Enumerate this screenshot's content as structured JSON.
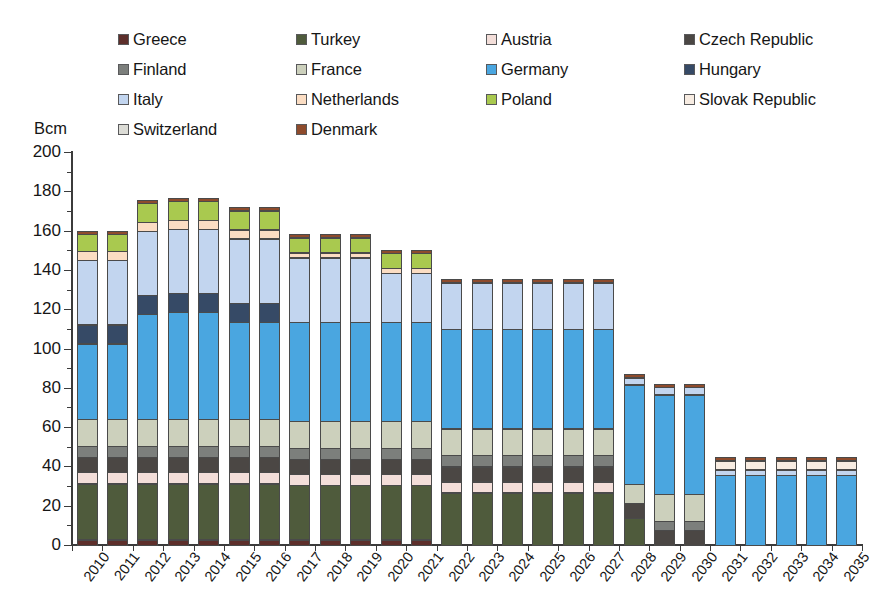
{
  "axis": {
    "y_unit_label": "Bcm",
    "y_ticks": [
      0,
      20,
      40,
      60,
      80,
      100,
      120,
      140,
      160,
      180,
      200
    ]
  },
  "legend": {
    "rows": [
      [
        {
          "label": "Greece",
          "color": "#5d2f2b"
        },
        {
          "label": "Turkey",
          "color": "#4f5b3c"
        },
        {
          "label": "Austria",
          "color": "#f3ded9"
        },
        {
          "label": "Czech Republic",
          "color": "#4b4744"
        }
      ],
      [
        {
          "label": "Finland",
          "color": "#7c7f7c"
        },
        {
          "label": "France",
          "color": "#ccd0bc"
        },
        {
          "label": "Germany",
          "color": "#4aa6e0"
        },
        {
          "label": "Hungary",
          "color": "#364a66"
        }
      ],
      [
        {
          "label": "Italy",
          "color": "#c2d5ef"
        },
        {
          "label": "Netherlands",
          "color": "#fbddc3"
        },
        {
          "label": "Poland",
          "color": "#a9c94f"
        },
        {
          "label": "Slovak Republic",
          "color": "#f7ece2"
        }
      ],
      [
        {
          "label": "Switzerland",
          "color": "#dcdcd6"
        },
        {
          "label": "Denmark",
          "color": "#8e4b2c"
        }
      ]
    ]
  },
  "chart_data": {
    "type": "bar",
    "stacked": true,
    "title": "",
    "xlabel": "",
    "ylabel": "Bcm",
    "ylim": [
      0,
      200
    ],
    "ytick_step": 20,
    "yminor_step": 10,
    "grid": false,
    "legend_position": "top",
    "categories": [
      "2010",
      "2011",
      "2012",
      "2013",
      "2014",
      "2015",
      "2016",
      "2017",
      "2018",
      "2019",
      "2020",
      "2021",
      "2022",
      "2023",
      "2024",
      "2025",
      "2026",
      "2027",
      "2028",
      "2029",
      "2030",
      "2031",
      "2032",
      "2033",
      "2034",
      "2035"
    ],
    "series": [
      {
        "name": "Greece",
        "color": "#5d2f2b",
        "values": [
          3,
          3,
          3,
          3,
          3,
          3,
          3,
          3,
          3,
          3,
          3,
          3,
          0,
          0,
          0,
          0,
          0,
          0,
          0,
          0,
          0,
          0,
          0,
          0,
          0,
          0
        ]
      },
      {
        "name": "Turkey",
        "color": "#4f5b3c",
        "values": [
          29,
          29,
          29,
          29,
          29,
          29,
          29,
          28,
          28,
          28,
          28,
          28,
          27,
          27,
          27,
          27,
          27,
          27,
          14,
          0,
          0,
          0,
          0,
          0,
          0,
          0
        ]
      },
      {
        "name": "Austria",
        "color": "#f3ded9",
        "values": [
          6,
          6,
          6,
          6,
          6,
          6,
          6,
          6,
          6,
          6,
          6,
          6,
          6,
          6,
          6,
          6,
          6,
          6,
          0,
          0,
          0,
          0,
          0,
          0,
          0,
          0
        ]
      },
      {
        "name": "Czech Republic",
        "color": "#4b4744",
        "values": [
          8,
          8,
          8,
          8,
          8,
          8,
          8,
          8,
          8,
          8,
          8,
          8,
          8,
          8,
          8,
          8,
          8,
          8,
          8,
          8,
          8,
          0,
          0,
          0,
          0,
          0
        ]
      },
      {
        "name": "Finland",
        "color": "#7c7f7c",
        "values": [
          6,
          6,
          6,
          6,
          6,
          6,
          6,
          6,
          6,
          6,
          6,
          6,
          6,
          6,
          6,
          6,
          6,
          6,
          0,
          5,
          5,
          0,
          0,
          0,
          0,
          0
        ]
      },
      {
        "name": "France",
        "color": "#ccd0bc",
        "values": [
          14,
          14,
          14,
          14,
          14,
          14,
          14,
          14,
          14,
          14,
          14,
          14,
          14,
          14,
          14,
          14,
          14,
          14,
          10,
          14,
          14,
          0,
          0,
          0,
          0,
          0
        ]
      },
      {
        "name": "Germany",
        "color": "#4aa6e0",
        "values": [
          39,
          39,
          54,
          55,
          55,
          50,
          50,
          51,
          51,
          51,
          51,
          51,
          51,
          51,
          51,
          51,
          51,
          51,
          51,
          51,
          51,
          36,
          36,
          36,
          36,
          36
        ]
      },
      {
        "name": "Hungary",
        "color": "#364a66",
        "values": [
          10,
          10,
          10,
          10,
          10,
          10,
          10,
          0,
          0,
          0,
          0,
          0,
          0,
          0,
          0,
          0,
          0,
          0,
          0,
          0,
          0,
          0,
          0,
          0,
          0,
          0
        ]
      },
      {
        "name": "Italy",
        "color": "#c2d5ef",
        "values": [
          33,
          33,
          33,
          33,
          33,
          33,
          33,
          33,
          33,
          33,
          25,
          25,
          24,
          24,
          24,
          24,
          24,
          24,
          4,
          4,
          4,
          3,
          3,
          3,
          3,
          3
        ]
      },
      {
        "name": "Netherlands",
        "color": "#fbddc3",
        "values": [
          5,
          5,
          5,
          5,
          5,
          5,
          5,
          3,
          3,
          3,
          3,
          3,
          0,
          0,
          0,
          0,
          0,
          0,
          0,
          0,
          0,
          0,
          0,
          0,
          0,
          0
        ]
      },
      {
        "name": "Poland",
        "color": "#a9c94f",
        "values": [
          9,
          9,
          10,
          10,
          10,
          10,
          10,
          8,
          8,
          8,
          8,
          8,
          0,
          0,
          0,
          0,
          0,
          0,
          0,
          0,
          0,
          0,
          0,
          0,
          0,
          0
        ]
      },
      {
        "name": "Slovak Republic",
        "color": "#f7ece2",
        "values": [
          0,
          0,
          0,
          0,
          0,
          0,
          0,
          0,
          0,
          0,
          0,
          0,
          0,
          0,
          0,
          0,
          0,
          0,
          0,
          0,
          0,
          5,
          5,
          5,
          5,
          5
        ]
      },
      {
        "name": "Switzerland",
        "color": "#dcdcd6",
        "values": [
          0,
          0,
          0,
          0,
          0,
          0,
          0,
          0,
          0,
          0,
          0,
          0,
          0,
          0,
          0,
          0,
          0,
          0,
          0,
          0,
          0,
          0,
          0,
          0,
          0,
          0
        ]
      },
      {
        "name": "Denmark",
        "color": "#8e4b2c",
        "values": [
          2,
          2,
          2,
          2,
          2,
          2,
          2,
          2,
          2,
          2,
          2,
          2,
          2,
          2,
          2,
          2,
          2,
          2,
          2,
          2,
          2,
          2,
          2,
          2,
          2,
          2
        ]
      }
    ],
    "totals": [
      164,
      164,
      180,
      181,
      181,
      176,
      176,
      159,
      159,
      159,
      154,
      154,
      138,
      138,
      138,
      138,
      138,
      138,
      89,
      84,
      84,
      46,
      46,
      46,
      46,
      46
    ]
  }
}
